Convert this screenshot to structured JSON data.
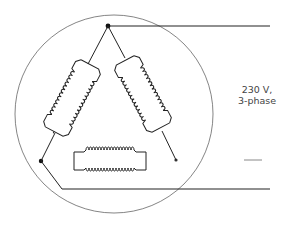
{
  "diagram": {
    "label_line1": "230 V,",
    "label_line2": "3-phase",
    "colors": {
      "stroke": "#222222",
      "circle": "#555555",
      "text": "#444444"
    },
    "supply_lines": 3,
    "windings": 3
  }
}
